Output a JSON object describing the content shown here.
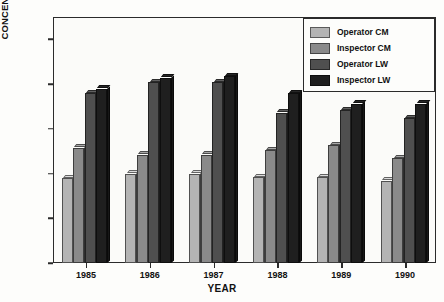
{
  "chart_data": {
    "type": "bar",
    "title": "",
    "xlabel": "YEAR",
    "ylabel": "CONCENTRATION, mg/m³",
    "categories": [
      "1985",
      "1986",
      "1987",
      "1988",
      "1989",
      "1990"
    ],
    "ylim": [
      0,
      2.75
    ],
    "yticks": [
      "0",
      ".5",
      "1.0",
      "1.5",
      "2.0",
      "2.5"
    ],
    "ytick_values": [
      0,
      0.5,
      1.0,
      1.5,
      2.0,
      2.5
    ],
    "grid": false,
    "legend_position": "top-right",
    "series": [
      {
        "name": "Operator CM",
        "color": "#b4b4b4",
        "values": [
          0.95,
          1.0,
          1.0,
          0.96,
          0.96,
          0.92
        ]
      },
      {
        "name": "Inspector CM",
        "color": "#8a8a8a",
        "values": [
          1.29,
          1.21,
          1.21,
          1.26,
          1.32,
          1.17
        ]
      },
      {
        "name": "Operator LW",
        "color": "#4f4f4f",
        "values": [
          1.9,
          2.02,
          2.02,
          1.68,
          1.71,
          1.62
        ]
      },
      {
        "name": "Inspector LW",
        "color": "#1f1f1f",
        "values": [
          1.95,
          2.07,
          2.09,
          1.9,
          1.78,
          1.78
        ]
      }
    ]
  },
  "axis": {
    "y_title_main": "CONCENTRATION, mg/m",
    "y_title_sup": "3",
    "x_title": "YEAR"
  }
}
